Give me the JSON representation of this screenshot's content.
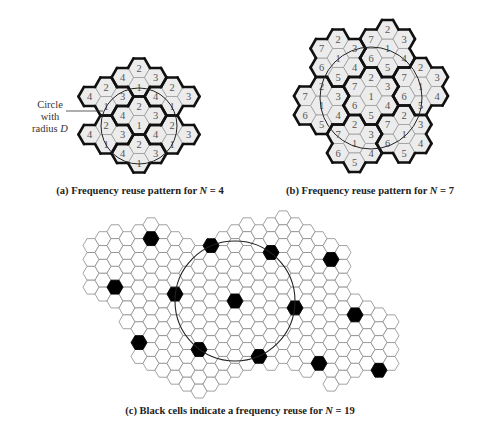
{
  "colors": {
    "background": "#ffffff",
    "cell_fill": "#ececec",
    "cell_fill_c": "#ffffff",
    "thin_line": "#9a9a9a",
    "thick_line": "#111111",
    "black_cell": "#000000",
    "circle": "#222222",
    "label_text": "#555555"
  },
  "panel_a": {
    "caption_prefix": "(a) Frequency reuse pattern for ",
    "caption_var": "N",
    "caption_suffix": " = 4",
    "reuse_factor": 4,
    "annotation_line1": "Circle with",
    "annotation_line2_prefix": "radius ",
    "annotation_line2_var": "D",
    "grid": {
      "origin_x": 139,
      "origin_y": 125,
      "hex_radius": 11,
      "dx": 16.5,
      "dy": 19
    },
    "circle": {
      "cx": 139,
      "cy": 126,
      "r": 38
    },
    "cells": [
      {
        "c": 0,
        "r": -2,
        "label": "1",
        "cluster": "A"
      },
      {
        "c": 0,
        "r": -3,
        "label": "2",
        "cluster": "A"
      },
      {
        "c": -1,
        "r": -3,
        "label": "4",
        "cluster": "A"
      },
      {
        "c": 1,
        "r": -3,
        "label": "3",
        "cluster": "A"
      },
      {
        "c": 0,
        "r": 0,
        "label": "1",
        "cluster": "B"
      },
      {
        "c": 0,
        "r": -1,
        "label": "2",
        "cluster": "B"
      },
      {
        "c": -1,
        "r": -1,
        "label": "4",
        "cluster": "B"
      },
      {
        "c": 1,
        "r": -1,
        "label": "3",
        "cluster": "B"
      },
      {
        "c": 0,
        "r": 2,
        "label": "1",
        "cluster": "C"
      },
      {
        "c": 0,
        "r": 1,
        "label": "2",
        "cluster": "C"
      },
      {
        "c": -1,
        "r": 1,
        "label": "4",
        "cluster": "C"
      },
      {
        "c": 1,
        "r": 1,
        "label": "3",
        "cluster": "C"
      },
      {
        "c": -2,
        "r": -1,
        "label": "1",
        "cluster": "D"
      },
      {
        "c": -2,
        "r": -2,
        "label": "2",
        "cluster": "D"
      },
      {
        "c": -3,
        "r": -2,
        "label": "4",
        "cluster": "D"
      },
      {
        "c": -1,
        "r": -2,
        "label": "3",
        "cluster": "D"
      },
      {
        "c": -2,
        "r": 1,
        "label": "1",
        "cluster": "E"
      },
      {
        "c": -2,
        "r": 0,
        "label": "2",
        "cluster": "E"
      },
      {
        "c": -3,
        "r": 0,
        "label": "4",
        "cluster": "E"
      },
      {
        "c": -1,
        "r": 0,
        "label": "3",
        "cluster": "E"
      },
      {
        "c": 2,
        "r": -1,
        "label": "1",
        "cluster": "F"
      },
      {
        "c": 2,
        "r": -2,
        "label": "2",
        "cluster": "F"
      },
      {
        "c": 1,
        "r": -2,
        "label": "4",
        "cluster": "F"
      },
      {
        "c": 3,
        "r": -2,
        "label": "3",
        "cluster": "F"
      },
      {
        "c": 2,
        "r": 1,
        "label": "1",
        "cluster": "G"
      },
      {
        "c": 2,
        "r": 0,
        "label": "2",
        "cluster": "G"
      },
      {
        "c": 1,
        "r": 0,
        "label": "4",
        "cluster": "G"
      },
      {
        "c": 3,
        "r": 0,
        "label": "3",
        "cluster": "G"
      }
    ]
  },
  "panel_b": {
    "caption_prefix": "(b) Frequency reuse pattern for ",
    "caption_var": "N",
    "caption_suffix": " = 7",
    "reuse_factor": 7,
    "grid": {
      "origin_x": 371,
      "origin_y": 96,
      "hex_radius": 11,
      "dx": 16.5,
      "dy": 19
    },
    "circle": {
      "cx": 371,
      "cy": 98,
      "r": 51
    },
    "cluster_layout": {
      "1": [
        0,
        0
      ],
      "2": "N",
      "3": "NE",
      "4": "SE",
      "5": "S",
      "6": "SW",
      "7": "NW"
    },
    "cluster_centers": [
      {
        "id": "center",
        "c": 0,
        "r": 0
      },
      {
        "id": "upper-left",
        "c": -2,
        "r": -2
      },
      {
        "id": "top",
        "c": 1,
        "r": -3
      },
      {
        "id": "right",
        "c": 3,
        "r": -1
      },
      {
        "id": "lower-right",
        "c": 2,
        "r": 2
      },
      {
        "id": "bottom",
        "c": -1,
        "r": 2
      },
      {
        "id": "left",
        "c": -3,
        "r": 0
      }
    ]
  },
  "panel_c": {
    "caption_prefix": "(c) Black cells indicate a frequency reuse for ",
    "caption_var": "N",
    "caption_suffix": " = 19",
    "reuse_factor": 19,
    "grid": {
      "origin_x": 235,
      "origin_y": 301,
      "hex_radius": 8,
      "dx": 12,
      "dy": 13.86
    },
    "circle": {
      "cx": 235,
      "cy": 301,
      "r": 60
    },
    "columns": [
      {
        "c": -12,
        "rmin": -4,
        "rmax": -1
      },
      {
        "c": -11,
        "rmin": -5,
        "rmax": -1
      },
      {
        "c": -10,
        "rmin": -5,
        "rmax": 0
      },
      {
        "c": -9,
        "rmin": -5,
        "rmax": 1
      },
      {
        "c": -8,
        "rmin": -5,
        "rmax": 4
      },
      {
        "c": -7,
        "rmin": -6,
        "rmax": 4
      },
      {
        "c": -6,
        "rmin": -5,
        "rmax": 5
      },
      {
        "c": -5,
        "rmin": -5,
        "rmax": 5
      },
      {
        "c": -4,
        "rmin": -4,
        "rmax": 6
      },
      {
        "c": -3,
        "rmin": -4,
        "rmax": 6
      },
      {
        "c": -2,
        "rmin": -4,
        "rmax": 6
      },
      {
        "c": -1,
        "rmin": -5,
        "rmax": 5
      },
      {
        "c": 0,
        "rmin": -5,
        "rmax": 5
      },
      {
        "c": 1,
        "rmin": -6,
        "rmax": 4
      },
      {
        "c": 2,
        "rmin": -5,
        "rmax": 4
      },
      {
        "c": 3,
        "rmin": -6,
        "rmax": 4
      },
      {
        "c": 4,
        "rmin": -6,
        "rmax": 4
      },
      {
        "c": 5,
        "rmin": -6,
        "rmax": 4
      },
      {
        "c": 6,
        "rmin": -5,
        "rmax": 5
      },
      {
        "c": 7,
        "rmin": -5,
        "rmax": 4
      },
      {
        "c": 8,
        "rmin": -4,
        "rmax": 6
      },
      {
        "c": 9,
        "rmin": -4,
        "rmax": 5
      },
      {
        "c": 10,
        "rmin": 0,
        "rmax": 5
      },
      {
        "c": 11,
        "rmin": 0,
        "rmax": 4
      },
      {
        "c": 12,
        "rmin": 1,
        "rmax": 5
      },
      {
        "c": 13,
        "rmin": 1,
        "rmax": 4
      }
    ],
    "black_cells": [
      {
        "c": -7,
        "r": -5
      },
      {
        "c": -2,
        "r": -4
      },
      {
        "c": 3,
        "r": -4
      },
      {
        "c": 8,
        "r": -3
      },
      {
        "c": -10,
        "r": -1
      },
      {
        "c": -5,
        "r": -1
      },
      {
        "c": 0,
        "r": 0
      },
      {
        "c": 5,
        "r": 0
      },
      {
        "c": 10,
        "r": 1
      },
      {
        "c": -8,
        "r": 3
      },
      {
        "c": -3,
        "r": 3
      },
      {
        "c": 2,
        "r": 4
      },
      {
        "c": 7,
        "r": 4
      },
      {
        "c": 12,
        "r": 5
      }
    ]
  }
}
